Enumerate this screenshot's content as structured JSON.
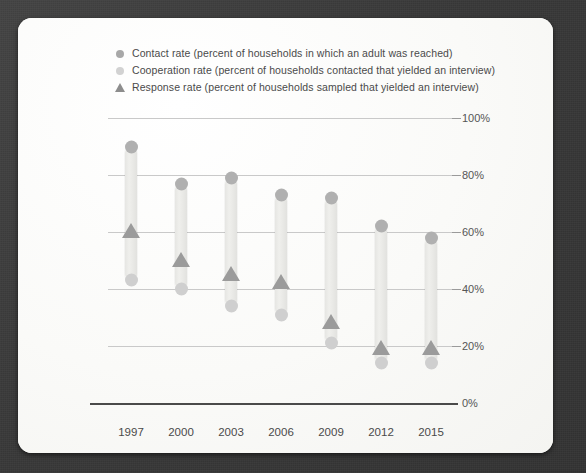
{
  "card": {
    "background_color": "#fbfbfa",
    "backdrop_color": "#3b3b3b"
  },
  "legend": {
    "position": "top-left",
    "items": [
      {
        "marker": "circle-marker",
        "marker_color": "#a8a8a8",
        "label": "Contact rate (percent of households in which an adult was reached)"
      },
      {
        "marker": "circle-marker",
        "marker_color": "#d2d2d2",
        "label": "Cooperation rate (percent of households contacted that yielded an interview)"
      },
      {
        "marker": "triangle-marker",
        "marker_color": "#8d8d8d",
        "label": "Response rate (percent of households sampled that yielded an interview)"
      }
    ]
  },
  "chart_data": {
    "type": "bar",
    "title": "",
    "subtitle": "",
    "xlabel": "",
    "ylabel": "",
    "ylim": [
      0,
      100
    ],
    "yticks": [
      "0%",
      "20%",
      "40%",
      "60%",
      "80%",
      "100%"
    ],
    "ytick_values": [
      0,
      20,
      40,
      60,
      80,
      100
    ],
    "grid": true,
    "legend_position": "top-left",
    "categories": [
      "1997",
      "2000",
      "2003",
      "2006",
      "2009",
      "2012",
      "2015"
    ],
    "series": [
      {
        "name": "Contact rate",
        "marker": "circle",
        "color": "#b0b0b0",
        "values": [
          90,
          77,
          79,
          73,
          72,
          62,
          58
        ]
      },
      {
        "name": "Cooperation rate",
        "marker": "circle",
        "color": "#cfcfcf",
        "values": [
          43,
          40,
          34,
          31,
          21,
          14,
          14
        ]
      },
      {
        "name": "Response rate",
        "marker": "triangle",
        "color": "#9b9b9b",
        "values": [
          60,
          50,
          45,
          42,
          28,
          19,
          19
        ]
      }
    ]
  }
}
